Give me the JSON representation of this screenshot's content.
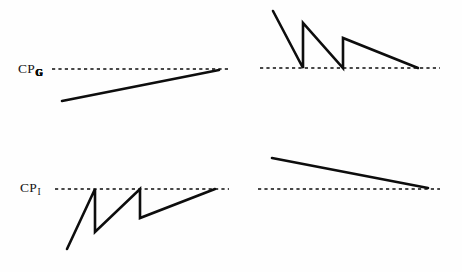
{
  "figure": {
    "background_color": "#fefefe",
    "ink_color": "#0d0d0d",
    "width": 462,
    "height": 272,
    "labels": {
      "upper": {
        "base": "CP",
        "subscript": "G",
        "full": "CP_G"
      },
      "lower": {
        "base": "CP",
        "subscript": "I",
        "full": "CP_I"
      }
    }
  },
  "chart_data": {
    "type": "line",
    "title": "",
    "xlabel": "",
    "ylabel": "",
    "grid": false,
    "legend": null,
    "panels": [
      {
        "id": "top-left",
        "name": "upper-left-panel",
        "reference_label": "CP_G",
        "reference_line": {
          "style": "dashed",
          "y": 69,
          "x_start": 52,
          "x_end": 229
        },
        "series": [
          {
            "name": "rising-line",
            "shape": "monotonic-rising",
            "points": [
              [
                62,
                101
              ],
              [
                219,
                70
              ]
            ]
          }
        ],
        "description": "Single straight line rising from below the reference level and meeting it at the right end."
      },
      {
        "id": "top-right",
        "name": "upper-right-panel",
        "reference_label": "CP_G",
        "reference_line": {
          "style": "dashed",
          "y": 68,
          "x_start": 260,
          "x_end": 440
        },
        "series": [
          {
            "name": "falling-sawtooth",
            "shape": "sawtooth-descending",
            "points": [
              [
                273,
                11
              ],
              [
                303,
                68
              ],
              [
                303,
                23
              ],
              [
                343,
                68
              ],
              [
                343,
                38
              ],
              [
                418,
                68
              ]
            ]
          }
        ],
        "description": "Descending sawtooth with three falling ramps, each dropping to the reference line then jumping upward."
      },
      {
        "id": "bottom-left",
        "name": "lower-left-panel",
        "reference_label": "CP_I",
        "reference_line": {
          "style": "dashed",
          "y": 189,
          "x_start": 55,
          "x_end": 229
        },
        "series": [
          {
            "name": "rising-sawtooth",
            "shape": "sawtooth-ascending",
            "points": [
              [
                67,
                249
              ],
              [
                95,
                189
              ],
              [
                95,
                232
              ],
              [
                140,
                189
              ],
              [
                140,
                218
              ],
              [
                215,
                189
              ]
            ]
          }
        ],
        "description": "Ascending sawtooth with three rising ramps, each reaching the reference line then dropping back down."
      },
      {
        "id": "bottom-right",
        "name": "lower-right-panel",
        "reference_label": "CP_I",
        "reference_line": {
          "style": "dashed",
          "y": 189,
          "x_start": 258,
          "x_end": 440
        },
        "series": [
          {
            "name": "falling-line",
            "shape": "monotonic-falling",
            "points": [
              [
                272,
                158
              ],
              [
                428,
                188
              ]
            ]
          }
        ],
        "description": "Single straight line falling from above the reference level and meeting it at the right end."
      }
    ]
  }
}
